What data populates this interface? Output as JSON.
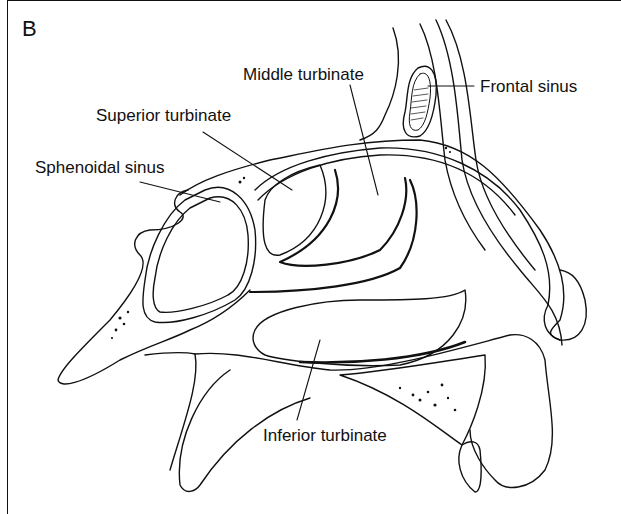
{
  "figure": {
    "panel_letter": "B",
    "labels": {
      "middle_turbinate": "Middle turbinate",
      "frontal_sinus": "Frontal sinus",
      "superior_turbinate": "Superior turbinate",
      "sphenoidal_sinus": "Sphenoidal sinus",
      "inferior_turbinate": "Inferior turbinate"
    },
    "colors": {
      "ink": "#111111",
      "background": "#ffffff"
    }
  }
}
